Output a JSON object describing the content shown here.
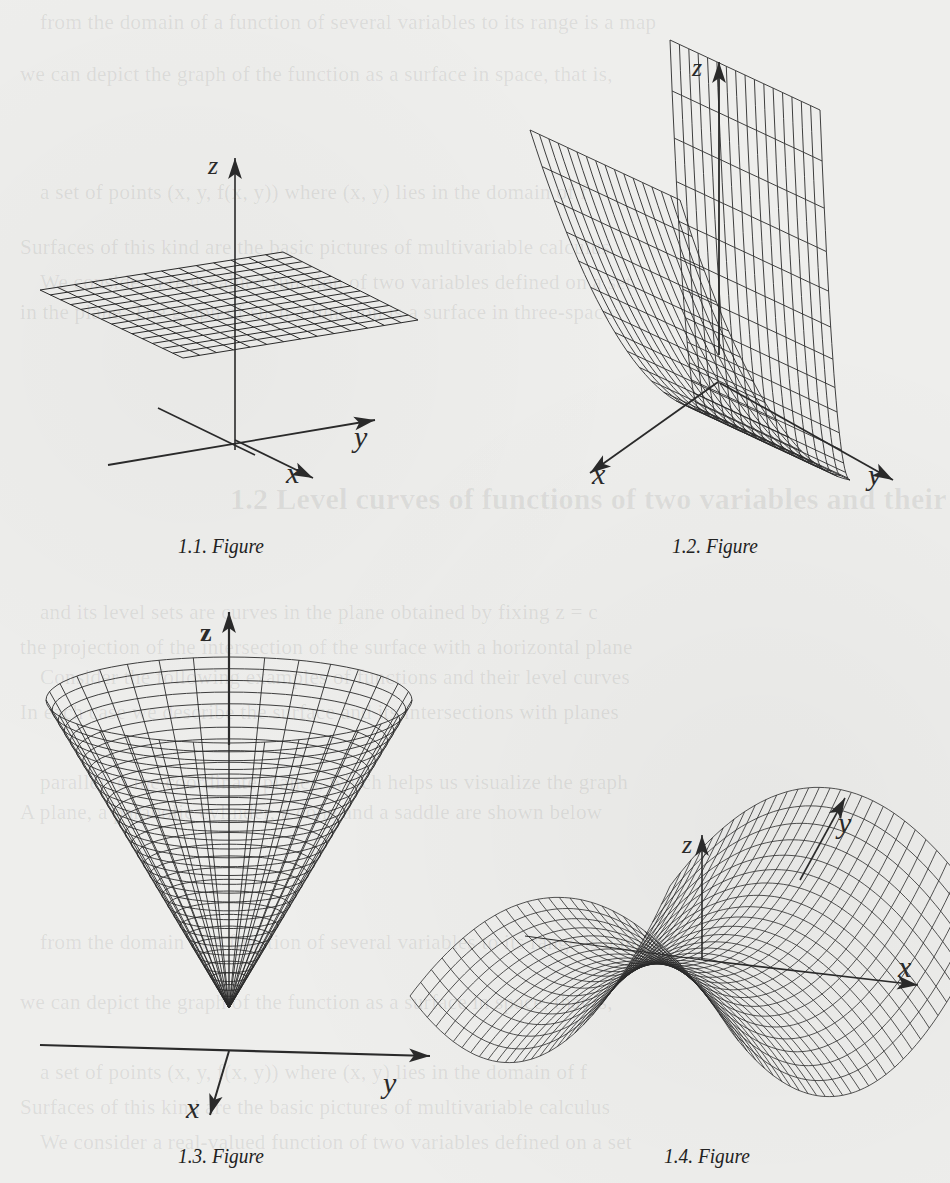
{
  "page": {
    "background": "#eeeeec",
    "ink": "#2a2a2a",
    "bleed_through_heading": "1.2 Level curves of functions of two variables and their graphs",
    "bleed_through_lines": [
      "from the domain of a function of several variables to its range is a map",
      "we can depict the graph of the function as a surface in space, that is,",
      "a set of points (x, y, f(x, y)) where (x, y) lies in the domain of f",
      "Surfaces of this kind are the basic pictures of multivariable calculus",
      "We consider a real-valued function of two variables defined on a set",
      "in the plane. The graph of such a function is a surface in three-space",
      "and its level sets are curves in the plane obtained by fixing z = c",
      "the projection of the intersection of the surface with a horizontal plane",
      "Consider the following examples of functions and their level curves",
      "In each case we describe the surface and its intersections with planes",
      "parallel to the coordinate planes, which helps us visualize the graph",
      "A plane, a parabolic cylinder, a cone and a saddle are shown below"
    ]
  },
  "figures": [
    {
      "id": "1.1",
      "caption": "1.1. Figure",
      "surface": "horizontal plane z = c",
      "axes": {
        "x": "x",
        "y": "y",
        "z": "z"
      },
      "grid": {
        "rows": 14,
        "cols": 14
      }
    },
    {
      "id": "1.2",
      "caption": "1.2. Figure",
      "surface": "parabolic cylinder z = x^2",
      "axes": {
        "x": "x",
        "y": "y",
        "z": "z"
      },
      "grid": {
        "rows": 28,
        "cols": 16
      }
    },
    {
      "id": "1.3",
      "caption": "1.3. Figure",
      "surface": "cone z = sqrt(x^2 + y^2)",
      "axes": {
        "x": "x",
        "y": "y",
        "z": "z"
      },
      "grid": {
        "rings": 30,
        "meridians": 32
      }
    },
    {
      "id": "1.4",
      "caption": "1.4. Figure",
      "surface": "saddle z = y^2 - x^2",
      "axes": {
        "x": "x",
        "y": "y",
        "z": "z"
      },
      "grid": {
        "rows": 30,
        "cols": 30
      }
    }
  ]
}
